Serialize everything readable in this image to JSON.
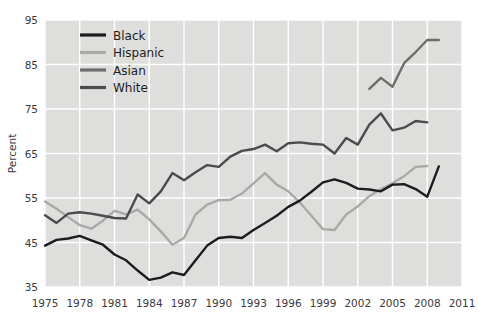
{
  "chart_data": {
    "type": "line",
    "title": "",
    "xlabel": "",
    "ylabel": "Percent",
    "xlim": [
      1975,
      2011
    ],
    "ylim": [
      35,
      95
    ],
    "xticks": [
      1975,
      1978,
      1981,
      1984,
      1987,
      1990,
      1993,
      1996,
      1999,
      2002,
      2005,
      2008,
      2011
    ],
    "yticks": [
      35,
      45,
      55,
      65,
      75,
      85,
      95
    ],
    "grid": true,
    "legend_position": "top-left",
    "background_color": "#dededd",
    "gridline_color": "#ffffff",
    "series": [
      {
        "name": "Black",
        "color": "#1c1c1c",
        "x": [
          1975,
          1976,
          1977,
          1978,
          1979,
          1980,
          1981,
          1982,
          1983,
          1984,
          1985,
          1986,
          1987,
          1988,
          1989,
          1990,
          1991,
          1992,
          1993,
          1994,
          1995,
          1996,
          1997,
          1998,
          1999,
          2000,
          2001,
          2002,
          2003,
          2004,
          2005,
          2006,
          2007,
          2008,
          2009
        ],
        "y": [
          44.3,
          45.6,
          45.9,
          46.5,
          45.5,
          44.5,
          42.3,
          41.0,
          38.7,
          36.6,
          37.1,
          38.3,
          37.7,
          41.0,
          44.3,
          46.0,
          46.3,
          46.0,
          47.8,
          49.4,
          51.0,
          53.0,
          54.4,
          56.4,
          58.5,
          59.2,
          58.4,
          57.1,
          56.9,
          56.5,
          58.0,
          58.1,
          57.0,
          55.3,
          62.1
        ]
      },
      {
        "name": "Hispanic",
        "color": "#a9a9a8",
        "x": [
          1975,
          1976,
          1977,
          1978,
          1979,
          1980,
          1981,
          1982,
          1983,
          1984,
          1985,
          1986,
          1987,
          1988,
          1989,
          1990,
          1991,
          1992,
          1993,
          1994,
          1995,
          1996,
          1997,
          1998,
          1999,
          2000,
          2001,
          2002,
          2003,
          2004,
          2005,
          2006,
          2007,
          2008
        ],
        "y": [
          54.2,
          52.6,
          50.7,
          48.9,
          48.1,
          49.9,
          52.1,
          51.3,
          52.4,
          50.2,
          47.5,
          44.5,
          46.0,
          51.3,
          53.5,
          54.5,
          54.6,
          56.0,
          58.3,
          60.6,
          58.0,
          56.5,
          54.0,
          51.0,
          48.0,
          47.8,
          51.3,
          53.1,
          55.4,
          57.0,
          58.3,
          59.9,
          62.0,
          62.2
        ]
      },
      {
        "name": "Asian",
        "color": "#6d6d6c",
        "x": [
          2003,
          2004,
          2005,
          2006,
          2007,
          2008,
          2009
        ],
        "y": [
          79.5,
          82.0,
          80.0,
          85.3,
          87.8,
          90.5,
          90.5
        ]
      },
      {
        "name": "White",
        "color": "#4b4b4b",
        "x": [
          1975,
          1976,
          1977,
          1978,
          1979,
          1980,
          1981,
          1982,
          1983,
          1984,
          1985,
          1986,
          1987,
          1988,
          1989,
          1990,
          1991,
          1992,
          1993,
          1994,
          1995,
          1996,
          1997,
          1998,
          1999,
          2000,
          2001,
          2002,
          2003,
          2004,
          2005,
          2006,
          2007,
          2008
        ],
        "y": [
          51.1,
          49.4,
          51.5,
          51.8,
          51.5,
          51.0,
          50.5,
          50.4,
          55.8,
          53.8,
          56.5,
          60.6,
          59.0,
          60.8,
          62.4,
          62.0,
          64.3,
          65.6,
          66.0,
          67.0,
          65.5,
          67.3,
          67.5,
          67.2,
          67.0,
          65.0,
          68.5,
          67.0,
          71.5,
          74.0,
          70.2,
          70.8,
          72.3,
          72.0
        ]
      }
    ],
    "legend": [
      {
        "label": "Black",
        "color": "#1c1c1c"
      },
      {
        "label": "Hispanic",
        "color": "#a9a9a8"
      },
      {
        "label": "Asian",
        "color": "#6d6d6c"
      },
      {
        "label": "White",
        "color": "#4b4b4b"
      }
    ]
  }
}
